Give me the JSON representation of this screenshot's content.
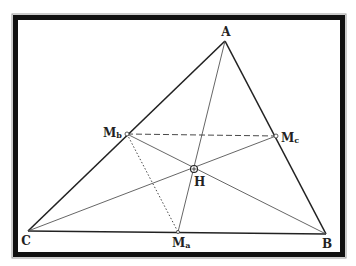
{
  "diagram": {
    "colors": {
      "background": "#ffffff",
      "frame": "#111111",
      "frame_edge": "#9a9a9a",
      "sides": "#222222",
      "cevians": "#555555",
      "text": "#222222"
    },
    "points": {
      "A": {
        "label": "A",
        "sub": "",
        "x": 225,
        "y": 41,
        "lx": 226,
        "ly": 36
      },
      "B": {
        "label": "B",
        "sub": "",
        "x": 326,
        "y": 234,
        "lx": 327,
        "ly": 248
      },
      "C": {
        "label": "C",
        "sub": "",
        "x": 28,
        "y": 231,
        "lx": 26,
        "ly": 245
      },
      "Ma": {
        "label": "M",
        "sub": "a",
        "x": 178,
        "y": 232,
        "lx": 172,
        "ly": 247
      },
      "Mb": {
        "label": "M",
        "sub": "b",
        "x": 127,
        "y": 134,
        "lx": 103,
        "ly": 137
      },
      "Mc": {
        "label": "M",
        "sub": "c",
        "x": 276,
        "y": 136,
        "lx": 281,
        "ly": 142
      },
      "H": {
        "label": "H",
        "sub": "",
        "x": 194,
        "y": 169,
        "lx": 194,
        "ly": 186
      }
    },
    "segments": [
      {
        "name": "side-AB",
        "from": "A",
        "to": "B",
        "style": "solid-thick"
      },
      {
        "name": "side-AC",
        "from": "A",
        "to": "C",
        "style": "solid-thick"
      },
      {
        "name": "side-BC",
        "from": "C",
        "to": "B",
        "style": "solid-thick"
      },
      {
        "name": "cevian-A-Ma",
        "from": "A",
        "to": "Ma",
        "style": "solid-thin"
      },
      {
        "name": "cevian-B-Mb",
        "from": "Mb",
        "to": "B",
        "style": "solid-thin"
      },
      {
        "name": "cevian-C-Mc",
        "from": "C",
        "to": "Mc",
        "style": "solid-thin"
      },
      {
        "name": "midline-Mb-Mc",
        "from": "Mb",
        "to": "Mc",
        "style": "dashed"
      },
      {
        "name": "segment-Mb-Ma",
        "from": "Mb",
        "to": "Ma",
        "style": "dotted"
      }
    ]
  }
}
